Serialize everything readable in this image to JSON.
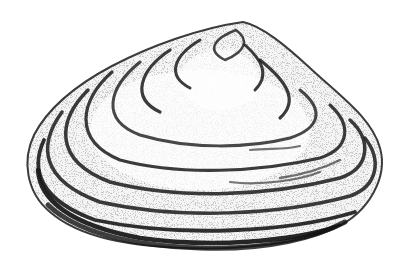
{
  "image": {
    "subject": "bivalve clam shell illustration",
    "style": "black and white stippled drawing",
    "colors": {
      "background": "#ffffff",
      "ink": "#1a1a1a",
      "shade": "#555555"
    }
  }
}
